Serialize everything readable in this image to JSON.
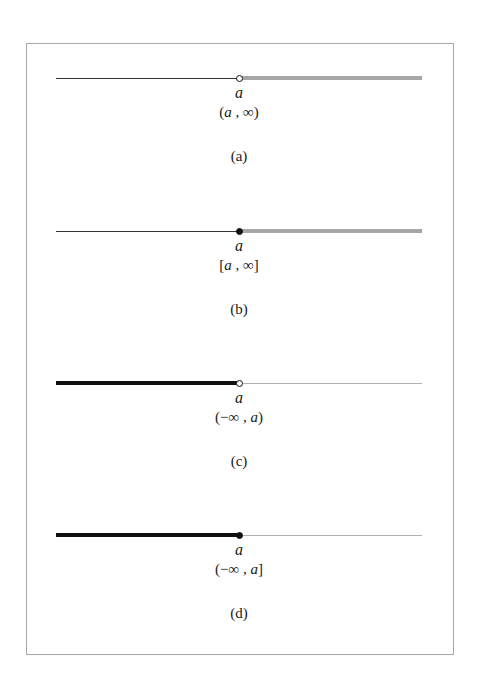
{
  "figure": {
    "panels": [
      {
        "id": "a",
        "variable": "a",
        "interval_open": "(",
        "interval_left": "a",
        "interval_sep": " , ",
        "interval_right": "∞",
        "interval_close": ")",
        "caption": "(a)",
        "endpoint": "open",
        "shaded_side": "right",
        "shade_style": "thick-gray"
      },
      {
        "id": "b",
        "variable": "a",
        "interval_open": "[",
        "interval_left": "a",
        "interval_sep": " , ",
        "interval_right": "∞",
        "interval_close": "]",
        "caption": "(b)",
        "endpoint": "closed",
        "shaded_side": "right",
        "shade_style": "thick-gray"
      },
      {
        "id": "c",
        "variable": "a",
        "interval_open": "(",
        "interval_left": "−∞",
        "interval_sep": " , ",
        "interval_right": "a",
        "interval_close": ")",
        "caption": "(c)",
        "endpoint": "open",
        "shaded_side": "left",
        "shade_style": "thick-dark"
      },
      {
        "id": "d",
        "variable": "a",
        "interval_open": "(",
        "interval_left": "−∞",
        "interval_sep": " , ",
        "interval_right": "a",
        "interval_close": "]",
        "caption": "(d)",
        "endpoint": "closed",
        "shaded_side": "left",
        "shade_style": "thick-dark"
      }
    ]
  },
  "colors": {
    "frame_border": "#a8a8a8",
    "thin_line": "#333333",
    "shade_gray": "#a6a6a6",
    "shade_dark": "#111111",
    "thin_gray": "#b0b0b0"
  }
}
